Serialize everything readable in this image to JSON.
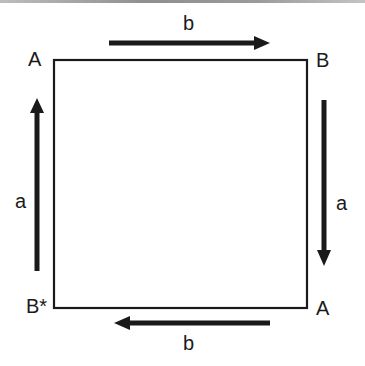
{
  "diagram": {
    "title": "",
    "colors": {
      "stroke": "#1a1a1a",
      "background": "#ffffff"
    },
    "square": {
      "x": 54,
      "y": 60,
      "width": 253,
      "height": 248
    },
    "vertices": {
      "top_left": "A",
      "top_right": "B",
      "bottom_right": "A",
      "bottom_left": "B*"
    },
    "edges": {
      "top": {
        "label": "b",
        "direction": "right"
      },
      "right": {
        "label": "a",
        "direction": "down"
      },
      "bottom": {
        "label": "b",
        "direction": "left"
      },
      "left": {
        "label": "a",
        "direction": "up"
      }
    }
  }
}
